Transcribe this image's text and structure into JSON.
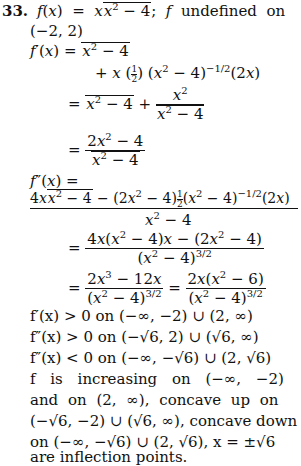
{
  "problem": {
    "number": "33.",
    "statement": "f(x) = x√(x² − 4); f undefined on",
    "statement_cont": "(−2, 2)",
    "first_derivative": {
      "label": "f′(x) =",
      "step1a": "√(x² − 4)",
      "step1b": "+ x (½) (x² − 4)^(−1/2) (2x)",
      "step2": "= √(x² − 4) + x² / √(x² − 4)",
      "step3": "= (2x² − 4) / √(x² − 4)"
    },
    "second_derivative": {
      "label": "f″(x) =",
      "numerator": "4x√(x² − 4) − (2x² − 4)½(x² − 4)^(−1/2)(2x)",
      "denominator": "x² − 4",
      "step2": "= (4x(x² − 4)x − (2x² − 4)) / (x² − 4)^(3/2)",
      "step3": "= (2x³ − 12x)/(x² − 4)^(3/2) = 2x(x² − 6)/(x² − 4)^(3/2)"
    },
    "sign_analysis": [
      "f′(x) > 0 on (−∞, −2) ∪ (2, ∞)",
      "f″(x) > 0 on (−√6, 2) ∪ (√6, ∞)",
      "f″(x) < 0 on (−∞, −√6) ∪ (2, √6)"
    ],
    "conclusion": [
      "f is increasing on (−∞, −2)",
      "and on (2, ∞), concave up on",
      "(−√6, −2) ∪ (√6, ∞), concave down",
      "on (−∞, −√6) ∪ (2, √6), x = ±√6",
      "are inflection points."
    ]
  }
}
